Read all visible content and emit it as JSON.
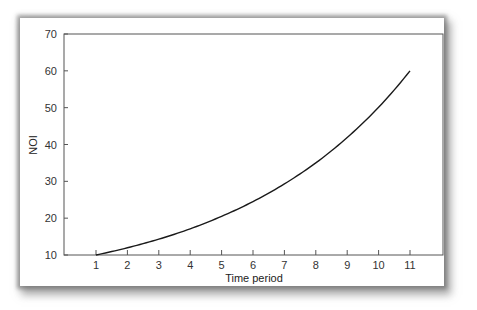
{
  "chart_data": {
    "type": "line",
    "title": "",
    "xlabel": "Time period",
    "ylabel": "NOI",
    "x": [
      1,
      2,
      3,
      4,
      5,
      6,
      7,
      8,
      9,
      10,
      11
    ],
    "series": [
      {
        "name": "NOI",
        "values": [
          10.0,
          11.96,
          14.3,
          17.1,
          20.5,
          24.5,
          29.3,
          35.0,
          41.9,
          50.1,
          60.0
        ]
      }
    ],
    "xticks": [
      "1",
      "2",
      "3",
      "4",
      "5",
      "6",
      "7",
      "8",
      "9",
      "10",
      "11"
    ],
    "yticks": [
      "10",
      "20",
      "30",
      "40",
      "50",
      "60",
      "70"
    ],
    "xlim": [
      0,
      12
    ],
    "ylim": [
      10,
      70
    ],
    "grid": false,
    "legend": "none"
  }
}
